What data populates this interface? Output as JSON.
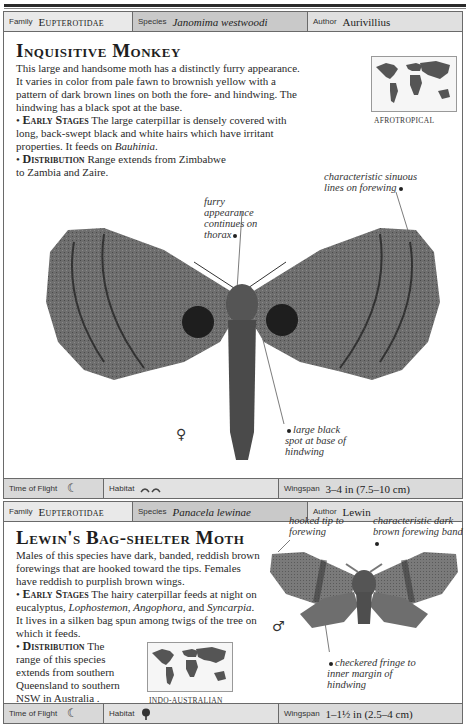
{
  "page": {
    "header_rule": true
  },
  "entries": [
    {
      "family_label": "Family",
      "family": "Eupterotidae",
      "species_label": "Species",
      "species": "Janomima westwoodi",
      "author_label": "Author",
      "author": "Aurivillius",
      "title": "Inquisitive Monkey",
      "description": "This large and handsome moth has a distinctly furry appearance. It varies in color from pale fawn to brownish yellow with a pattern of dark brown lines on both the fore- and hindwing. The hindwing has a black spot at the base.",
      "early_stages_heading": "Early Stages",
      "early_stages_text_1": "The large caterpillar is densely covered with long, back-swept black and white hairs which have irritant properties. It feeds on ",
      "early_stages_italic_1": "Bauhinia",
      "early_stages_text_2": ".",
      "distribution_heading": "Distribution",
      "distribution_text": "Range extends from Zimbabwe to Zambia and Zaire.",
      "map_label": "AFROTROPICAL",
      "annotations": {
        "sinuous_lines": "characteristic sinuous lines on forewing",
        "thorax": "furry appearance continues on thorax",
        "black_spot": "large black spot at base of hindwing"
      },
      "sex_symbol": "♀",
      "time_of_flight_label": "Time of Flight",
      "time_of_flight_icon": "moon-icon",
      "time_of_flight_glyph": "☾",
      "habitat_label": "Habitat",
      "habitat_icon": "grassland-icon",
      "habitat_glyph": "ᨓᨓ",
      "wingspan_label": "Wingspan",
      "wingspan": "3–4 in (7.5–10 cm)"
    },
    {
      "family_label": "Family",
      "family": "Eupterotidae",
      "species_label": "Species",
      "species": "Panacela lewinae",
      "author_label": "Author",
      "author": "Lewin",
      "title": "Lewin's Bag-shelter Moth",
      "description": "Males of this species have dark, banded, reddish brown forewings that are hooked toward the tips. Females have reddish to purplish brown wings.",
      "early_stages_heading": "Early Stages",
      "early_stages_text_1": "The hairy caterpillar feeds at night on eucalyptus, ",
      "early_stages_italic_1": "Lophostemon",
      "early_stages_text_2": ", ",
      "early_stages_italic_2": "Angophora",
      "early_stages_text_3": ", and ",
      "early_stages_italic_3": "Syncarpia",
      "early_stages_text_4": ". It lives in a silken bag spun among twigs of the tree on which it feeds.",
      "distribution_heading": "Distribution",
      "distribution_text": "The range of this species extends from southern Queensland to southern NSW in Australia .",
      "map_label": "INDO-AUSTRALIAN",
      "annotations": {
        "hooked_tip": "hooked tip to forewing",
        "dark_band": "characteristic dark brown forewing band",
        "checkered_fringe": "checkered fringe to inner margin of hindwing"
      },
      "sex_symbol": "♂",
      "time_of_flight_label": "Time of Flight",
      "time_of_flight_icon": "moon-icon",
      "time_of_flight_glyph": "☾",
      "habitat_label": "Habitat",
      "habitat_icon": "tree-icon",
      "habitat_glyph": "♣",
      "wingspan_label": "Wingspan",
      "wingspan": "1–1½ in (2.5–4 cm)"
    }
  ]
}
